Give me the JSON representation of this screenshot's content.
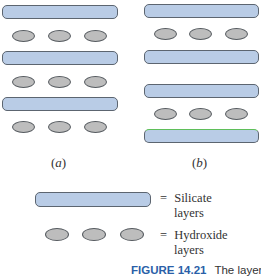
{
  "figure": {
    "panel_a": {
      "label_open": "(",
      "label_letter": "a",
      "label_close": ")",
      "sequence": [
        "silicate",
        "hydroxide",
        "silicate",
        "hydroxide",
        "silicate",
        "hydroxide"
      ]
    },
    "panel_b": {
      "label_open": "(",
      "label_letter": "b",
      "label_close": ")",
      "sequence": [
        "silicate",
        "hydroxide",
        "silicate",
        "silicate",
        "hydroxide",
        "silicate"
      ]
    },
    "legend": {
      "silicate": {
        "eq": "=",
        "line1": "Silicate",
        "line2": "layers",
        "color": "#b9cce6"
      },
      "hydroxide": {
        "eq": "=",
        "line1": "Hydroxide",
        "line2": "layers",
        "color": "#bdbdbd"
      }
    },
    "caption": {
      "figure_number": "FIGURE 14.21",
      "text": "The layer",
      "color": "#2a5fa8"
    }
  }
}
